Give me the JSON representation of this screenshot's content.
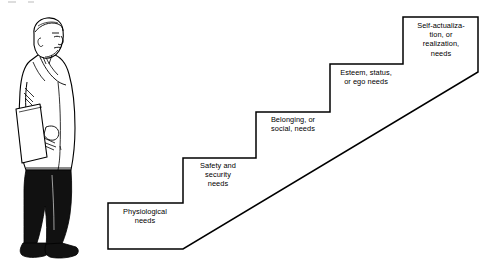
{
  "diagram": {
    "background_color": "#ffffff",
    "line_color": "#000000",
    "text_color": "#000000",
    "figure": {
      "name": "man-walking-figure",
      "description": "Line drawing of a man in a light coat and dark trousers, facing right, carrying a folder under his arm"
    },
    "steps": [
      {
        "index": 1,
        "id": "physiological",
        "label": "Physiological\nneeds"
      },
      {
        "index": 2,
        "id": "safety",
        "label": "Safety and\nsecurity\nneeds"
      },
      {
        "index": 3,
        "id": "belonging",
        "label": "Belonging, or\nsocial, needs"
      },
      {
        "index": 4,
        "id": "esteem",
        "label": "Esteem, status,\nor ego needs"
      },
      {
        "index": 5,
        "id": "self-actualization",
        "label": "Self-actualiza-\ntion, or\nrealization,\nneeds"
      }
    ]
  }
}
